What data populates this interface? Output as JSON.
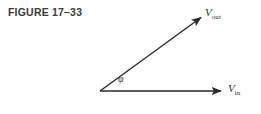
{
  "figure": {
    "caption": "FIGURE 17–33",
    "background_color": "#ffffff",
    "line_color": "#2b2b2d",
    "caption_color": "#3a3a3c",
    "width": 261,
    "height": 114
  },
  "diagram": {
    "type": "phasor-vector-diagram",
    "vertex": {
      "x": 100,
      "y": 91
    },
    "vectors": [
      {
        "name": "v-out",
        "label_text": "V",
        "label_subscript": "out",
        "from": {
          "x": 100,
          "y": 91
        },
        "to": {
          "x": 203,
          "y": 16
        },
        "arrowhead": true
      },
      {
        "name": "v-in",
        "label_text": "V",
        "label_subscript": "in",
        "from": {
          "x": 100,
          "y": 91
        },
        "to": {
          "x": 224,
          "y": 91
        },
        "arrowhead": true
      }
    ],
    "angle": {
      "symbol": "φ",
      "name": "phase-angle-phi",
      "arc_radius": 26,
      "between": [
        "v-in",
        "v-out"
      ]
    }
  }
}
